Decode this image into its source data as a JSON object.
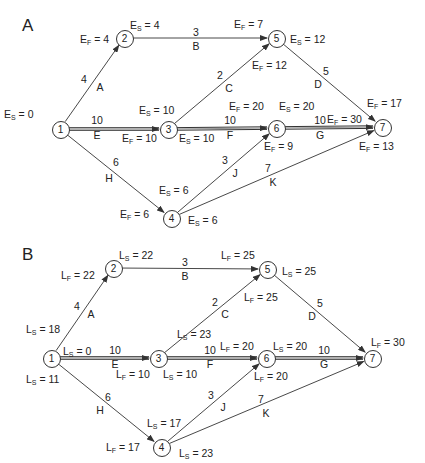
{
  "panels": [
    {
      "id": "A",
      "letter": "A",
      "letter_pos": [
        22,
        16
      ],
      "nodes": [
        {
          "id": "1",
          "x": 60,
          "y": 129
        },
        {
          "id": "2",
          "x": 124,
          "y": 38
        },
        {
          "id": "3",
          "x": 168,
          "y": 129
        },
        {
          "id": "4",
          "x": 171,
          "y": 218
        },
        {
          "id": "5",
          "x": 276,
          "y": 38
        },
        {
          "id": "6",
          "x": 276,
          "y": 128
        },
        {
          "id": "7",
          "x": 382,
          "y": 127
        }
      ],
      "edges": [
        {
          "from": "1",
          "to": "2",
          "activity": "A",
          "duration": "4",
          "critical": false,
          "dur_pos": [
            84,
            79
          ],
          "act_pos": [
            100,
            87
          ]
        },
        {
          "from": "2",
          "to": "5",
          "activity": "B",
          "duration": "3",
          "critical": false,
          "dur_pos": [
            196,
            32
          ],
          "act_pos": [
            196,
            46
          ]
        },
        {
          "from": "3",
          "to": "5",
          "activity": "C",
          "duration": "2",
          "critical": false,
          "dur_pos": [
            220,
            75
          ],
          "act_pos": [
            229,
            88
          ]
        },
        {
          "from": "5",
          "to": "7",
          "activity": "D",
          "duration": "5",
          "critical": false,
          "dur_pos": [
            326,
            71
          ],
          "act_pos": [
            318,
            84
          ]
        },
        {
          "from": "1",
          "to": "3",
          "activity": "E",
          "duration": "10",
          "critical": true,
          "dur_pos": [
            97,
            120
          ],
          "act_pos": [
            97,
            135
          ]
        },
        {
          "from": "3",
          "to": "6",
          "activity": "F",
          "duration": "10",
          "critical": true,
          "dur_pos": [
            230,
            120
          ],
          "act_pos": [
            230,
            135
          ]
        },
        {
          "from": "6",
          "to": "7",
          "activity": "G",
          "duration": "10",
          "critical": true,
          "dur_pos": [
            320,
            120
          ],
          "act_pos": [
            320,
            135
          ]
        },
        {
          "from": "1",
          "to": "4",
          "activity": "H",
          "duration": "6",
          "critical": false,
          "dur_pos": [
            116,
            162
          ],
          "act_pos": [
            109,
            178
          ]
        },
        {
          "from": "4",
          "to": "6",
          "activity": "J",
          "duration": "3",
          "critical": false,
          "dur_pos": [
            225,
            160
          ],
          "act_pos": [
            235,
            173
          ]
        },
        {
          "from": "4",
          "to": "7",
          "activity": "K",
          "duration": "7",
          "critical": false,
          "dur_pos": [
            268,
            168
          ],
          "act_pos": [
            273,
            182
          ]
        }
      ],
      "labels": [
        {
          "var": "E",
          "sub": "S",
          "value": "0",
          "x": 4,
          "y": 108
        },
        {
          "var": "E",
          "sub": "F",
          "value": "4",
          "x": 80,
          "y": 33
        },
        {
          "var": "E",
          "sub": "S",
          "value": "4",
          "x": 130,
          "y": 19
        },
        {
          "var": "E",
          "sub": "F",
          "value": "7",
          "x": 234,
          "y": 18
        },
        {
          "var": "E",
          "sub": "S",
          "value": "12",
          "x": 290,
          "y": 33
        },
        {
          "var": "E",
          "sub": "F",
          "value": "12",
          "x": 252,
          "y": 59
        },
        {
          "var": "E",
          "sub": "S",
          "value": "10",
          "x": 139,
          "y": 104
        },
        {
          "var": "E",
          "sub": "F",
          "value": "10",
          "x": 122,
          "y": 132
        },
        {
          "var": "E",
          "sub": "S",
          "value": "10",
          "x": 179,
          "y": 132
        },
        {
          "var": "E",
          "sub": "F",
          "value": "20",
          "x": 229,
          "y": 100
        },
        {
          "var": "E",
          "sub": "S",
          "value": "20",
          "x": 279,
          "y": 100
        },
        {
          "var": "E",
          "sub": "F",
          "value": "30",
          "x": 327,
          "y": 113
        },
        {
          "var": "E",
          "sub": "F",
          "value": "17",
          "x": 367,
          "y": 97
        },
        {
          "var": "E",
          "sub": "F",
          "value": "9",
          "x": 264,
          "y": 140
        },
        {
          "var": "E",
          "sub": "F",
          "value": "13",
          "x": 359,
          "y": 140
        },
        {
          "var": "E",
          "sub": "S",
          "value": "6",
          "x": 159,
          "y": 184
        },
        {
          "var": "E",
          "sub": "F",
          "value": "6",
          "x": 120,
          "y": 208
        },
        {
          "var": "E",
          "sub": "S",
          "value": "6",
          "x": 188,
          "y": 214
        }
      ]
    },
    {
      "id": "B",
      "letter": "B",
      "letter_pos": [
        22,
        245
      ],
      "nodes": [
        {
          "id": "1",
          "x": 51,
          "y": 358
        },
        {
          "id": "2",
          "x": 113,
          "y": 268
        },
        {
          "id": "3",
          "x": 158,
          "y": 358
        },
        {
          "id": "4",
          "x": 161,
          "y": 447
        },
        {
          "id": "5",
          "x": 267,
          "y": 269
        },
        {
          "id": "6",
          "x": 266,
          "y": 358
        },
        {
          "id": "7",
          "x": 372,
          "y": 358
        }
      ],
      "edges": [
        {
          "from": "1",
          "to": "2",
          "activity": "A",
          "duration": "4",
          "critical": false,
          "dur_pos": [
            77,
            306
          ],
          "act_pos": [
            91,
            314
          ]
        },
        {
          "from": "2",
          "to": "5",
          "activity": "B",
          "duration": "3",
          "critical": false,
          "dur_pos": [
            185,
            262
          ],
          "act_pos": [
            185,
            276
          ]
        },
        {
          "from": "3",
          "to": "5",
          "activity": "C",
          "duration": "2",
          "critical": false,
          "dur_pos": [
            215,
            302
          ],
          "act_pos": [
            225,
            314
          ]
        },
        {
          "from": "5",
          "to": "7",
          "activity": "D",
          "duration": "5",
          "critical": false,
          "dur_pos": [
            320,
            303
          ],
          "act_pos": [
            312,
            316
          ]
        },
        {
          "from": "1",
          "to": "3",
          "activity": "E",
          "duration": "10",
          "critical": true,
          "dur_pos": [
            115,
            350
          ],
          "act_pos": [
            115,
            364
          ]
        },
        {
          "from": "3",
          "to": "6",
          "activity": "F",
          "duration": "10",
          "critical": true,
          "dur_pos": [
            210,
            350
          ],
          "act_pos": [
            210,
            364
          ]
        },
        {
          "from": "6",
          "to": "7",
          "activity": "G",
          "duration": "10",
          "critical": true,
          "dur_pos": [
            324,
            350
          ],
          "act_pos": [
            324,
            364
          ]
        },
        {
          "from": "1",
          "to": "4",
          "activity": "H",
          "duration": "6",
          "critical": false,
          "dur_pos": [
            108,
            397
          ],
          "act_pos": [
            100,
            410
          ]
        },
        {
          "from": "4",
          "to": "6",
          "activity": "J",
          "duration": "3",
          "critical": false,
          "dur_pos": [
            211,
            395
          ],
          "act_pos": [
            223,
            407
          ]
        },
        {
          "from": "4",
          "to": "7",
          "activity": "K",
          "duration": "7",
          "critical": false,
          "dur_pos": [
            261,
            399
          ],
          "act_pos": [
            266,
            413
          ]
        }
      ],
      "labels": [
        {
          "var": "L",
          "sub": "F",
          "value": "22",
          "x": 61,
          "y": 269
        },
        {
          "var": "L",
          "sub": "S",
          "value": "22",
          "x": 119,
          "y": 249
        },
        {
          "var": "L",
          "sub": "F",
          "value": "25",
          "x": 221,
          "y": 249
        },
        {
          "var": "L",
          "sub": "S",
          "value": "25",
          "x": 282,
          "y": 265
        },
        {
          "var": "L",
          "sub": "F",
          "value": "25",
          "x": 244,
          "y": 291
        },
        {
          "var": "L",
          "sub": "S",
          "value": "18",
          "x": 26,
          "y": 323
        },
        {
          "var": "L",
          "sub": "S",
          "value": "0",
          "x": 63,
          "y": 345
        },
        {
          "var": "L",
          "sub": "S",
          "value": "11",
          "x": 26,
          "y": 373
        },
        {
          "var": "L",
          "sub": "S",
          "value": "23",
          "x": 177,
          "y": 328
        },
        {
          "var": "L",
          "sub": "F",
          "value": "20",
          "x": 220,
          "y": 340
        },
        {
          "var": "L",
          "sub": "S",
          "value": "20",
          "x": 273,
          "y": 340
        },
        {
          "var": "L",
          "sub": "F",
          "value": "10",
          "x": 116,
          "y": 368
        },
        {
          "var": "L",
          "sub": "S",
          "value": "10",
          "x": 163,
          "y": 368
        },
        {
          "var": "L",
          "sub": "F",
          "value": "20",
          "x": 254,
          "y": 370
        },
        {
          "var": "L",
          "sub": "F",
          "value": "30",
          "x": 371,
          "y": 336
        },
        {
          "var": "L",
          "sub": "S",
          "value": "17",
          "x": 147,
          "y": 417
        },
        {
          "var": "L",
          "sub": "F",
          "value": "17",
          "x": 106,
          "y": 441
        },
        {
          "var": "L",
          "sub": "S",
          "value": "23",
          "x": 179,
          "y": 447
        }
      ]
    }
  ],
  "colors": {
    "line": "#333333",
    "text": "#222222",
    "background": "#ffffff"
  }
}
